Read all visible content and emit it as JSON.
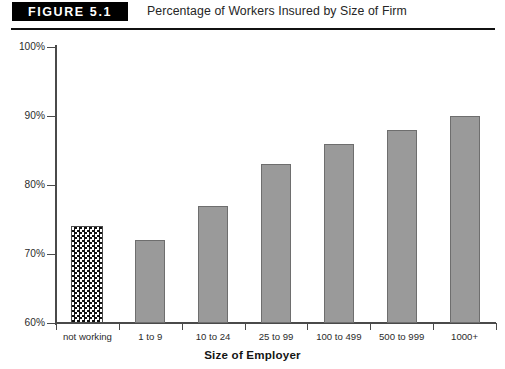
{
  "header": {
    "badge_label": "FIGURE 5.1",
    "title": "Percentage of Workers Insured by Size of Firm"
  },
  "chart_data": {
    "type": "bar",
    "title": "Percentage of Workers Insured by Size of Firm",
    "xlabel": "Size of Employer",
    "ylabel": "",
    "ylim": [
      60,
      100
    ],
    "ytick_labels": [
      "100%",
      "90%",
      "80%",
      "70%",
      "60%"
    ],
    "ytick_values": [
      100,
      90,
      80,
      70,
      60
    ],
    "grid": false,
    "legend": null,
    "categories": [
      "not working",
      "1 to 9",
      "10 to 24",
      "25 to 99",
      "100 to 499",
      "500 to 999",
      "1000+"
    ],
    "values": [
      74,
      72,
      77,
      83,
      86,
      88,
      90
    ],
    "bar_styles": [
      "checkered",
      "solid",
      "solid",
      "solid",
      "solid",
      "solid",
      "solid"
    ],
    "colors": {
      "bar_fill": "#9a9a9a",
      "bar_stroke": "#6e6e6e",
      "pattern_fill": "#111111",
      "pattern_background": "#ffffff",
      "axis": "#4a4a4a",
      "text": "#2b2b2b",
      "badge_background": "#000000",
      "badge_text": "#ffffff"
    }
  }
}
